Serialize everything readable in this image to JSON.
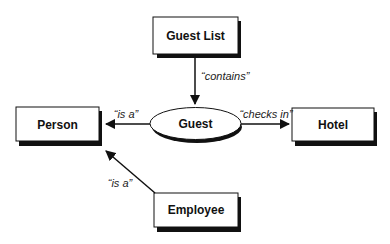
{
  "diagram": {
    "nodes": {
      "guest_list": {
        "label": "Guest List",
        "shape": "rectangle"
      },
      "guest": {
        "label": "Guest",
        "shape": "ellipse"
      },
      "person": {
        "label": "Person",
        "shape": "rectangle"
      },
      "hotel": {
        "label": "Hotel",
        "shape": "rectangle"
      },
      "employee": {
        "label": "Employee",
        "shape": "rectangle"
      }
    },
    "edges": {
      "contains": {
        "from": "Guest List",
        "to": "Guest",
        "label": "“contains”"
      },
      "guest_is_a": {
        "from": "Guest",
        "to": "Person",
        "label": "“is a”"
      },
      "checks_in": {
        "from": "Guest",
        "to": "Hotel",
        "label": "“checks in”"
      },
      "employee_is_a": {
        "from": "Employee",
        "to": "Person",
        "label": "“is a”"
      }
    },
    "colors": {
      "stroke": "#111111",
      "shadow": "#111111",
      "fill": "#ffffff"
    }
  }
}
